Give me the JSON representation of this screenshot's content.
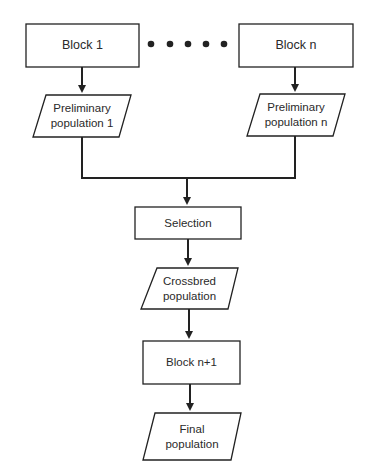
{
  "diagram": {
    "type": "flowchart",
    "nodes": {
      "block1": {
        "label": "Block 1",
        "shape": "rectangle"
      },
      "blockn": {
        "label": "Block n",
        "shape": "rectangle"
      },
      "prelim1": {
        "line1": "Preliminary",
        "line2": "population 1",
        "shape": "parallelogram"
      },
      "prelimn": {
        "line1": "Preliminary",
        "line2": "population n",
        "shape": "parallelogram"
      },
      "selection": {
        "label": "Selection",
        "shape": "rectangle"
      },
      "crossbred": {
        "line1": "Crossbred",
        "line2": "population",
        "shape": "parallelogram"
      },
      "blockn1": {
        "label": "Block n+1",
        "shape": "rectangle"
      },
      "final": {
        "line1": "Final",
        "line2": "population",
        "shape": "parallelogram"
      }
    },
    "ellipsis": {
      "count": 5,
      "meaning": "blocks 2 through n-1"
    },
    "edges": [
      [
        "Block 1",
        "Preliminary population 1"
      ],
      [
        "Block n",
        "Preliminary population n"
      ],
      [
        "Preliminary population 1",
        "Selection"
      ],
      [
        "Preliminary population n",
        "Selection"
      ],
      [
        "Selection",
        "Crossbred population"
      ],
      [
        "Crossbred population",
        "Block n+1"
      ],
      [
        "Block n+1",
        "Final population"
      ]
    ],
    "colors": {
      "stroke": "#222222",
      "background": "#ffffff",
      "text": "#2a2a2a"
    }
  }
}
